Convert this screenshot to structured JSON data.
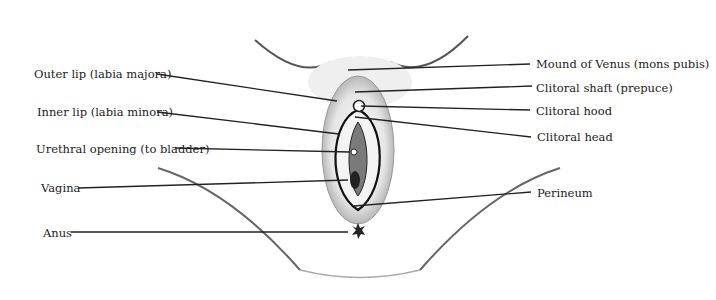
{
  "diagram": {
    "labels_left": [
      {
        "id": "outer-lip",
        "text": "Outer lip (labia majora)",
        "x": 34,
        "y": 67,
        "line": [
          157,
          74,
          337,
          101
        ]
      },
      {
        "id": "inner-lip",
        "text": "Inner lip (labia minora)",
        "x": 37,
        "y": 105,
        "line": [
          157,
          112,
          339,
          134
        ]
      },
      {
        "id": "urethral-opening",
        "text": "Urethral opening (to bladder)",
        "x": 36,
        "y": 142,
        "line": [
          175,
          148,
          350,
          152
        ]
      },
      {
        "id": "vagina",
        "text": "Vagina",
        "x": 41,
        "y": 181,
        "line": [
          78,
          188,
          348,
          180
        ]
      },
      {
        "id": "anus",
        "text": "Anus",
        "x": 43,
        "y": 226,
        "line": [
          71,
          232,
          348,
          232
        ]
      }
    ],
    "labels_right": [
      {
        "id": "mons-pubis",
        "text": "Mound of Venus (mons pubis)",
        "x": 536,
        "y": 57,
        "line": [
          348,
          70,
          530,
          64
        ]
      },
      {
        "id": "clitoral-shaft",
        "text": "Clitoral shaft (prepuce)",
        "x": 536,
        "y": 81,
        "line": [
          355,
          92,
          532,
          86
        ]
      },
      {
        "id": "clitoral-hood",
        "text": "Clitoral hood",
        "x": 536,
        "y": 104,
        "line": [
          361,
          106,
          530,
          110
        ]
      },
      {
        "id": "clitoral-head",
        "text": "Clitoral head",
        "x": 537,
        "y": 130,
        "line": [
          355,
          117,
          531,
          137
        ]
      },
      {
        "id": "perineum",
        "text": "Perineum",
        "x": 537,
        "y": 186,
        "line": [
          354,
          206,
          531,
          192
        ]
      }
    ],
    "colors": {
      "ink": "#1a1a1a",
      "line": "#222222",
      "shade": "#9a9a9a",
      "background": "#ffffff"
    }
  }
}
